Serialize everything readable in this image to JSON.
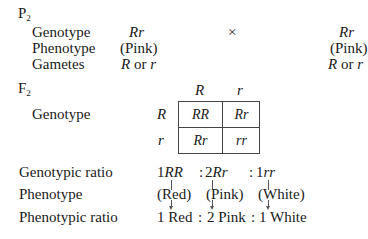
{
  "p2": {
    "label": "P",
    "label_sub": "2",
    "rows": [
      {
        "label": "Genotype",
        "left": "Rr",
        "right": "Rr",
        "italic": true
      },
      {
        "label": "Phenotype",
        "left": "(Pink)",
        "right": "(Pink)",
        "italic": false
      },
      {
        "label": "Gametes",
        "left_a": "R",
        "left_or": " or ",
        "left_b": "r",
        "right_a": "R",
        "right_or": " or ",
        "right_b": "r"
      }
    ],
    "cross_symbol": "×"
  },
  "f2": {
    "label": "F",
    "label_sub": "2",
    "genotype_label": "Genotype",
    "punnett": {
      "col_headers": [
        "R",
        "r"
      ],
      "row_headers": [
        "R",
        "r"
      ],
      "cells": [
        [
          "RR",
          "Rr"
        ],
        [
          "Rr",
          "rr"
        ]
      ]
    }
  },
  "summary": {
    "genotypic_ratio_label": "Genotypic ratio",
    "genotypic_ratio": [
      {
        "count": "1",
        "genotype": "RR"
      },
      {
        "count": "2",
        "genotype": "Rr"
      },
      {
        "count": "1",
        "genotype": "rr"
      }
    ],
    "separator": ":",
    "phenotype_label": "Phenotype",
    "phenotypes": [
      "(Red)",
      "(Pink)",
      "(White)"
    ],
    "phenotypic_ratio_label": "Phenotypic ratio",
    "phenotypic_ratio": [
      "1 Red",
      "2 Pink",
      "1 White"
    ]
  }
}
